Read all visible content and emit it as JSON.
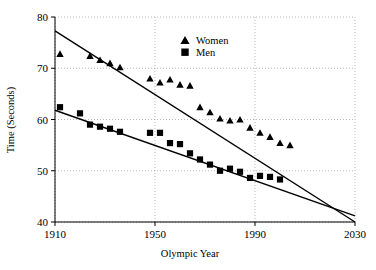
{
  "chart_data": {
    "type": "scatter",
    "title": "",
    "xlabel": "Olympic Year",
    "ylabel": "Time (Seconds)",
    "xlim": [
      1910,
      2030
    ],
    "ylim": [
      40,
      80
    ],
    "xticks": [
      1910,
      1950,
      1990,
      2030
    ],
    "yticks": [
      40,
      50,
      60,
      70,
      80
    ],
    "xtick_labels": [
      "1910",
      "1950",
      "1990",
      "2030"
    ],
    "ytick_labels": [
      "40",
      "50",
      "60",
      "70",
      "80"
    ],
    "grid": true,
    "grid_style": "dotted",
    "legend_position": "top-center-right",
    "series": [
      {
        "name": "Women",
        "marker": "triangle",
        "color": "#000000",
        "points": [
          {
            "x": 1912,
            "y": 72.8
          },
          {
            "x": 1924,
            "y": 72.4
          },
          {
            "x": 1928,
            "y": 71.6
          },
          {
            "x": 1932,
            "y": 71.0
          },
          {
            "x": 1936,
            "y": 70.2
          },
          {
            "x": 1948,
            "y": 68.0
          },
          {
            "x": 1952,
            "y": 67.2
          },
          {
            "x": 1956,
            "y": 67.8
          },
          {
            "x": 1960,
            "y": 66.8
          },
          {
            "x": 1964,
            "y": 66.6
          },
          {
            "x": 1968,
            "y": 62.4
          },
          {
            "x": 1972,
            "y": 61.4
          },
          {
            "x": 1976,
            "y": 60.2
          },
          {
            "x": 1980,
            "y": 59.8
          },
          {
            "x": 1984,
            "y": 60.0
          },
          {
            "x": 1988,
            "y": 58.4
          },
          {
            "x": 1992,
            "y": 57.4
          },
          {
            "x": 1996,
            "y": 56.6
          },
          {
            "x": 2000,
            "y": 55.4
          },
          {
            "x": 2004,
            "y": 55.0
          }
        ],
        "fit_line": {
          "x1": 1910,
          "y1": 77.3,
          "x2": 2030,
          "y2": 40.0
        }
      },
      {
        "name": "Men",
        "marker": "square",
        "color": "#000000",
        "points": [
          {
            "x": 1912,
            "y": 62.4
          },
          {
            "x": 1920,
            "y": 61.2
          },
          {
            "x": 1924,
            "y": 59.0
          },
          {
            "x": 1928,
            "y": 58.6
          },
          {
            "x": 1932,
            "y": 58.2
          },
          {
            "x": 1936,
            "y": 57.6
          },
          {
            "x": 1948,
            "y": 57.4
          },
          {
            "x": 1952,
            "y": 57.4
          },
          {
            "x": 1956,
            "y": 55.4
          },
          {
            "x": 1960,
            "y": 55.2
          },
          {
            "x": 1964,
            "y": 53.4
          },
          {
            "x": 1968,
            "y": 52.2
          },
          {
            "x": 1972,
            "y": 51.2
          },
          {
            "x": 1976,
            "y": 50.0
          },
          {
            "x": 1980,
            "y": 50.4
          },
          {
            "x": 1984,
            "y": 49.8
          },
          {
            "x": 1988,
            "y": 48.6
          },
          {
            "x": 1992,
            "y": 49.0
          },
          {
            "x": 1996,
            "y": 48.8
          },
          {
            "x": 2000,
            "y": 48.3
          }
        ],
        "fit_line": {
          "x1": 1910,
          "y1": 61.8,
          "x2": 2030,
          "y2": 41.2
        }
      }
    ],
    "legend": [
      {
        "label": "Women",
        "marker": "triangle"
      },
      {
        "label": "Men",
        "marker": "square"
      }
    ]
  }
}
